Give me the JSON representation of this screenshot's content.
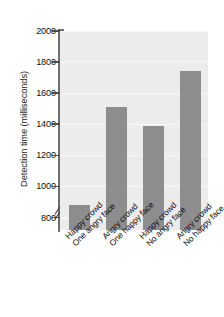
{
  "chart_data": {
    "type": "bar",
    "title": "",
    "xlabel": "",
    "ylabel": "Detection time (milliseconds)",
    "categories": [
      "Happy crowd\nOne angry face",
      "Angry crowd\nOne happy face",
      "Happy crowd\nNo angry face",
      "Angry crowd\nNo happy face"
    ],
    "category_lines": [
      [
        "Happy crowd",
        "One angry face"
      ],
      [
        "Angry crowd",
        "One happy face"
      ],
      [
        "Happy crowd",
        "No angry face"
      ],
      [
        "Angry crowd",
        "No happy face"
      ]
    ],
    "values": [
      880,
      1510,
      1390,
      1740
    ],
    "ylim": [
      720,
      2000
    ],
    "yticks": [
      800,
      1000,
      1200,
      1400,
      1600,
      1800,
      2000
    ],
    "ytick_labels": [
      "800",
      "1000",
      "1200",
      "1400",
      "1600",
      "1800",
      "2000"
    ],
    "grid": true,
    "legend": false,
    "axis_break": true,
    "bar_color": "#8d8d8d",
    "plot_background": "#ececec",
    "gridline_color": "#f7f7f7",
    "axis_color": "#6e6e6e",
    "text_color": "#111111"
  }
}
